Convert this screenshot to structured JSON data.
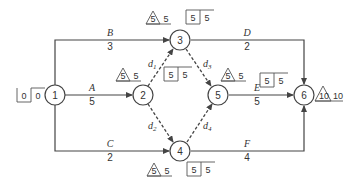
{
  "diagram": {
    "type": "activity-on-arrow network",
    "nodes": [
      {
        "id": "1",
        "label": "1",
        "x": 55,
        "y": 95
      },
      {
        "id": "2",
        "label": "2",
        "x": 143,
        "y": 95
      },
      {
        "id": "3",
        "label": "3",
        "x": 180,
        "y": 40
      },
      {
        "id": "4",
        "label": "4",
        "x": 180,
        "y": 151
      },
      {
        "id": "5",
        "label": "5",
        "x": 218,
        "y": 95
      },
      {
        "id": "6",
        "label": "6",
        "x": 304,
        "y": 95
      }
    ],
    "activities": [
      {
        "name": "A",
        "duration": "5",
        "from": "1",
        "to": "2"
      },
      {
        "name": "B",
        "duration": "3",
        "from": "1",
        "to": "3"
      },
      {
        "name": "C",
        "duration": "2",
        "from": "1",
        "to": "4"
      },
      {
        "name": "D",
        "duration": "2",
        "from": "3",
        "to": "6"
      },
      {
        "name": "E",
        "duration": "5",
        "from": "5",
        "to": "6"
      },
      {
        "name": "F",
        "duration": "4",
        "from": "4",
        "to": "6"
      }
    ],
    "dummies": [
      {
        "name": "d",
        "sub": "1",
        "from": "2",
        "to": "3"
      },
      {
        "name": "d",
        "sub": "2",
        "from": "2",
        "to": "4"
      },
      {
        "name": "d",
        "sub": "3",
        "from": "3",
        "to": "5"
      },
      {
        "name": "d",
        "sub": "4",
        "from": "4",
        "to": "5"
      }
    ],
    "node_times": {
      "1": {
        "box": [
          "0",
          "0"
        ]
      },
      "2": {
        "tri": "5",
        "tri_val": "5",
        "box": [
          "5",
          "5"
        ]
      },
      "3": {
        "tri": "5",
        "tri_val": "5",
        "box": [
          "5",
          "5"
        ]
      },
      "4": {
        "tri": "5",
        "tri_val": "5",
        "box": [
          "5",
          "5"
        ]
      },
      "5": {
        "tri": "5",
        "tri_val": "5",
        "box": [
          "5",
          "5"
        ]
      },
      "6": {
        "tri": "10",
        "tri_val": "10"
      }
    }
  }
}
